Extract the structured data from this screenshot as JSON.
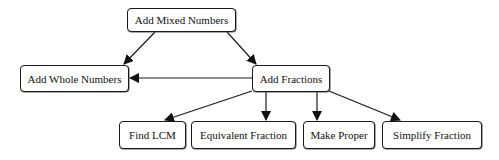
{
  "diagram": {
    "type": "hierarchy",
    "nodes": [
      {
        "id": "mixed",
        "label": "Add Mixed Numbers",
        "x": 127,
        "y": 8,
        "w": 109,
        "h": 24
      },
      {
        "id": "whole",
        "label": "Add Whole Numbers",
        "x": 20,
        "y": 65,
        "w": 109,
        "h": 27
      },
      {
        "id": "fractions",
        "label": "Add Fractions",
        "x": 252,
        "y": 65,
        "w": 78,
        "h": 27
      },
      {
        "id": "lcm",
        "label": "Find LCM",
        "x": 119,
        "y": 121,
        "w": 67,
        "h": 28
      },
      {
        "id": "equiv",
        "label": "Equivalent Fraction",
        "x": 191,
        "y": 121,
        "w": 105,
        "h": 28
      },
      {
        "id": "proper",
        "label": "Make Proper",
        "x": 303,
        "y": 121,
        "w": 72,
        "h": 28
      },
      {
        "id": "simplify",
        "label": "Simplify Fraction",
        "x": 382,
        "y": 121,
        "w": 100,
        "h": 28
      }
    ],
    "edges": [
      {
        "from": "mixed",
        "to": "whole"
      },
      {
        "from": "mixed",
        "to": "fractions"
      },
      {
        "from": "fractions",
        "to": "whole"
      },
      {
        "from": "fractions",
        "to": "lcm"
      },
      {
        "from": "fractions",
        "to": "equiv"
      },
      {
        "from": "fractions",
        "to": "proper"
      },
      {
        "from": "fractions",
        "to": "simplify"
      }
    ],
    "colors": {
      "stroke": "#1a1a1a",
      "background": "#ffffff",
      "text": "#111111"
    }
  }
}
